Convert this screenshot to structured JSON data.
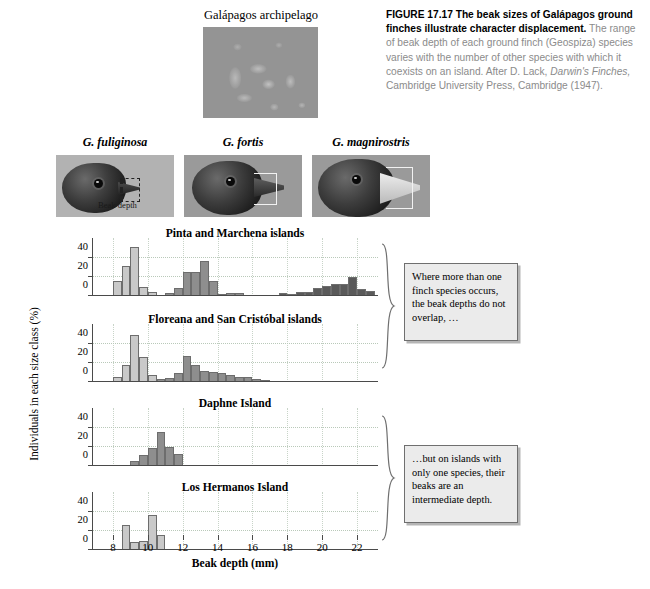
{
  "figure": {
    "number": "FIGURE 17.17",
    "title_bold": "The beak sizes of Galápagos ground finches illustrate character displacement.",
    "body": " The range of beak depth of each ground finch (Geospiza) species varies with the number of other species with which it coexists on an island. After D. Lack, ",
    "source_italic": "Darwin's Finches,",
    "body2": " Cambridge University Press, Cambridge (1947)."
  },
  "archipelago": {
    "label": "Galápagos archipelago"
  },
  "species_photos": [
    {
      "name": "G. fuliginosa",
      "measure_label": "Beak depth"
    },
    {
      "name": "G. fortis"
    },
    {
      "name": "G. magnirostris"
    }
  ],
  "axes": {
    "ylabel": "Individuals in each size class (%)",
    "xlabel": "Beak depth (mm)",
    "yticks": [
      0,
      20,
      40
    ],
    "ylim": [
      0,
      55
    ],
    "xticks": [
      8,
      10,
      12,
      14,
      16,
      18,
      20,
      22
    ],
    "xlim": [
      6.8,
      23.2
    ]
  },
  "colors": {
    "fuliginosa": "#c9c9c9",
    "fortis": "#8e8e8e",
    "magnirostris": "#5a5a5a",
    "callout_bg": "#ebebeb",
    "grid": "#b9c9b9"
  },
  "callouts": [
    {
      "id": "callout-overlap",
      "text": "Where more than one finch species occurs, the beak depths do not overlap, …"
    },
    {
      "id": "callout-intermediate",
      "text": "…but on islands with only one species, their beaks are an intermediate depth."
    }
  ],
  "chart_data": {
    "type": "bar",
    "title": "The beak sizes of Galápagos ground finches illustrate character displacement",
    "xlabel": "Beak depth (mm)",
    "ylabel": "Individuals in each size class (%)",
    "xlim": [
      6.8,
      23.2
    ],
    "ylim": [
      0,
      55
    ],
    "grid": true,
    "bin_width": 0.5,
    "legend": [
      "G. fuliginosa",
      "G. fortis",
      "G. magnirostris"
    ],
    "panels": [
      {
        "title": "Pinta and Marchena islands",
        "species_present": [
          "G. fuliginosa",
          "G. fortis",
          "G. magnirostris"
        ],
        "series": [
          {
            "name": "G. fuliginosa",
            "color": "#c9c9c9",
            "x": [
              8.0,
              8.5,
              9.0,
              9.5,
              10.0
            ],
            "values": [
              16,
              32,
              52,
              10,
              4
            ]
          },
          {
            "name": "G. fortis",
            "color": "#8e8e8e",
            "x": [
              11.0,
              11.5,
              12.0,
              12.5,
              13.0,
              13.5,
              14.0,
              14.5,
              15.0
            ],
            "values": [
              3,
              8,
              25,
              25,
              37,
              16,
              2,
              3,
              3
            ]
          },
          {
            "name": "G. magnirostris",
            "color": "#5a5a5a",
            "x": [
              17.5,
              18.0,
              18.5,
              19.0,
              19.5,
              20.0,
              20.5,
              21.0,
              21.5,
              22.0,
              22.5
            ],
            "values": [
              3,
              2,
              4,
              4,
              9,
              11,
              13,
              13,
              20,
              7,
              5
            ]
          }
        ]
      },
      {
        "title": "Floreana and San Cristóbal islands",
        "species_present": [
          "G. fuliginosa",
          "G. fortis"
        ],
        "series": [
          {
            "name": "G. fuliginosa",
            "color": "#c9c9c9",
            "x": [
              8.0,
              8.5,
              9.0,
              9.5,
              10.0
            ],
            "values": [
              5,
              18,
              50,
              26,
              7
            ]
          },
          {
            "name": "G. fortis",
            "color": "#8e8e8e",
            "x": [
              10.5,
              11.0,
              11.5,
              12.0,
              12.5,
              13.0,
              13.5,
              14.0,
              14.5,
              15.0,
              15.5,
              16.0,
              16.5
            ],
            "values": [
              3,
              4,
              10,
              27,
              18,
              12,
              11,
              10,
              7,
              5,
              5,
              3,
              2
            ]
          }
        ]
      },
      {
        "title": "Daphne Island",
        "species_present": [
          "G. fortis"
        ],
        "series": [
          {
            "name": "G. fortis",
            "color": "#8e8e8e",
            "x": [
              9.0,
              9.5,
              10.0,
              10.5,
              11.0,
              11.5
            ],
            "values": [
              5,
              12,
              19,
              36,
              20,
              13
            ]
          }
        ]
      },
      {
        "title": "Los Hermanos Island",
        "species_present": [
          "G. fuliginosa"
        ],
        "series": [
          {
            "name": "G. fuliginosa",
            "color": "#c9c9c9",
            "x": [
              8.5,
              9.0,
              9.5,
              10.0,
              10.5
            ],
            "values": [
              26,
              9,
              10,
              37,
              16
            ]
          }
        ]
      }
    ]
  }
}
